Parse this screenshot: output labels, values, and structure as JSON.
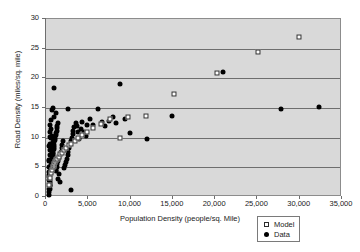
{
  "chart_data": {
    "type": "scatter",
    "title": "",
    "xlabel": "Population Density (people/sq. Mile)",
    "ylabel": "Road Density (miles/sq. mile)",
    "xlim": [
      0,
      35000
    ],
    "ylim": [
      0,
      30
    ],
    "xticks": [
      0,
      5000,
      10000,
      15000,
      20000,
      25000,
      30000,
      35000
    ],
    "xticklabels": [
      "0",
      "5,000",
      "10,000",
      "15,000",
      "20,000",
      "25,000",
      "30,000",
      "35,000"
    ],
    "yticks": [
      0,
      5,
      10,
      15,
      20,
      25,
      30
    ],
    "yticklabels": [
      "0",
      "5",
      "10",
      "15",
      "20",
      "25",
      "30"
    ],
    "grid": "horizontal",
    "plot_background": "#d9d9d9",
    "page_background": "#ffffff",
    "legend_position": "bottom-right",
    "series": [
      {
        "name": "Model",
        "marker": "open-square",
        "color": "#ffffff",
        "edge_color": "#2b2b2b",
        "points": [
          [
            400,
            2.0
          ],
          [
            500,
            3.2
          ],
          [
            600,
            4.0
          ],
          [
            700,
            4.6
          ],
          [
            800,
            5.0
          ],
          [
            900,
            5.3
          ],
          [
            1000,
            5.6
          ],
          [
            1100,
            5.9
          ],
          [
            1200,
            6.2
          ],
          [
            1300,
            6.4
          ],
          [
            1500,
            6.8
          ],
          [
            1700,
            7.2
          ],
          [
            1900,
            7.5
          ],
          [
            2100,
            7.9
          ],
          [
            2400,
            8.3
          ],
          [
            2700,
            8.7
          ],
          [
            3000,
            9.0
          ],
          [
            3400,
            9.5
          ],
          [
            3800,
            9.9
          ],
          [
            4300,
            10.4
          ],
          [
            4900,
            11.0
          ],
          [
            5600,
            11.6
          ],
          [
            6500,
            12.3
          ],
          [
            7600,
            13.2
          ],
          [
            8800,
            10.0
          ],
          [
            9700,
            13.5
          ],
          [
            11800,
            13.6
          ],
          [
            15100,
            17.3
          ],
          [
            20200,
            20.9
          ],
          [
            25100,
            24.5
          ],
          [
            29900,
            26.9
          ]
        ]
      },
      {
        "name": "Data",
        "marker": "filled-circle",
        "color": "#000000",
        "points": [
          [
            300,
            0.4
          ],
          [
            350,
            0.9
          ],
          [
            400,
            1.3
          ],
          [
            420,
            1.8
          ],
          [
            450,
            2.3
          ],
          [
            480,
            2.7
          ],
          [
            500,
            3.1
          ],
          [
            520,
            3.6
          ],
          [
            550,
            4.0
          ],
          [
            580,
            4.4
          ],
          [
            600,
            4.8
          ],
          [
            620,
            5.1
          ],
          [
            650,
            5.4
          ],
          [
            680,
            5.7
          ],
          [
            700,
            6.0
          ],
          [
            720,
            6.3
          ],
          [
            750,
            6.6
          ],
          [
            780,
            6.9
          ],
          [
            800,
            7.2
          ],
          [
            830,
            7.5
          ],
          [
            860,
            7.8
          ],
          [
            900,
            8.1
          ],
          [
            930,
            8.4
          ],
          [
            960,
            8.8
          ],
          [
            1000,
            9.2
          ],
          [
            1050,
            9.6
          ],
          [
            1100,
            10.0
          ],
          [
            1150,
            10.4
          ],
          [
            1200,
            10.8
          ],
          [
            1250,
            11.2
          ],
          [
            1300,
            11.6
          ],
          [
            1350,
            12.0
          ],
          [
            1400,
            12.4
          ],
          [
            450,
            11.0
          ],
          [
            500,
            12.2
          ],
          [
            600,
            13.0
          ],
          [
            700,
            10.2
          ],
          [
            800,
            9.3
          ],
          [
            380,
            8.6
          ],
          [
            320,
            6.1
          ],
          [
            360,
            4.2
          ],
          [
            410,
            3.4
          ],
          [
            470,
            2.0
          ],
          [
            520,
            1.4
          ],
          [
            900,
            18.3
          ],
          [
            1150,
            4.6
          ],
          [
            1250,
            5.1
          ],
          [
            1350,
            5.5
          ],
          [
            1450,
            6.0
          ],
          [
            1550,
            6.5
          ],
          [
            1650,
            7.0
          ],
          [
            1750,
            7.6
          ],
          [
            1850,
            8.2
          ],
          [
            1950,
            8.8
          ],
          [
            2050,
            9.4
          ],
          [
            2150,
            4.9
          ],
          [
            2250,
            5.4
          ],
          [
            2350,
            5.9
          ],
          [
            2450,
            6.4
          ],
          [
            2550,
            7.0
          ],
          [
            2650,
            7.6
          ],
          [
            2750,
            8.2
          ],
          [
            2850,
            8.8
          ],
          [
            2950,
            9.4
          ],
          [
            3050,
            10.0
          ],
          [
            3150,
            10.6
          ],
          [
            3250,
            11.2
          ],
          [
            3350,
            11.8
          ],
          [
            3500,
            12.5
          ],
          [
            3650,
            12.0
          ],
          [
            3800,
            10.9
          ],
          [
            3950,
            9.8
          ],
          [
            4100,
            11.5
          ],
          [
            4300,
            12.6
          ],
          [
            4500,
            11.0
          ],
          [
            4700,
            10.2
          ],
          [
            4900,
            12.2
          ],
          [
            5200,
            13.2
          ],
          [
            5600,
            12.1
          ],
          [
            3000,
            1.1
          ],
          [
            1600,
            2.6
          ],
          [
            1400,
            3.0
          ],
          [
            1500,
            3.8
          ],
          [
            6100,
            14.8
          ],
          [
            6600,
            12.6
          ],
          [
            7000,
            11.9
          ],
          [
            7400,
            12.8
          ],
          [
            7900,
            13.5
          ],
          [
            8300,
            12.4
          ],
          [
            8800,
            19.1
          ],
          [
            9300,
            13.1
          ],
          [
            9900,
            10.8
          ],
          [
            12000,
            9.7
          ],
          [
            14900,
            13.6
          ],
          [
            20900,
            21.0
          ],
          [
            27800,
            14.9
          ],
          [
            32300,
            15.1
          ],
          [
            700,
            14.6
          ],
          [
            850,
            15.0
          ],
          [
            1000,
            13.4
          ],
          [
            1200,
            14.1
          ],
          [
            2600,
            14.8
          ],
          [
            560,
            9.9
          ],
          [
            640,
            8.4
          ],
          [
            760,
            7.4
          ],
          [
            880,
            6.6
          ],
          [
            980,
            5.8
          ],
          [
            1080,
            5.0
          ],
          [
            1180,
            4.3
          ],
          [
            300,
            2.9
          ],
          [
            330,
            3.7
          ],
          [
            360,
            5.0
          ],
          [
            390,
            6.2
          ],
          [
            420,
            7.0
          ],
          [
            460,
            7.9
          ],
          [
            490,
            9.0
          ],
          [
            530,
            10.1
          ],
          [
            570,
            11.5
          ]
        ]
      }
    ]
  },
  "legend": {
    "entries": [
      {
        "label": "Model",
        "marker": "open-square"
      },
      {
        "label": "Data",
        "marker": "filled-circle"
      }
    ]
  }
}
